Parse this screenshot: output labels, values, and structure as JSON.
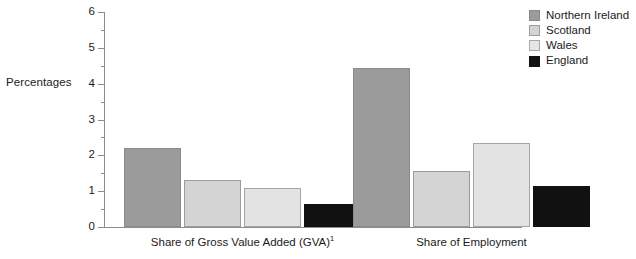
{
  "chart_data": {
    "type": "bar",
    "title": "",
    "xlabel": "",
    "ylabel": "Percentages",
    "ylim": [
      0,
      6
    ],
    "ytick_values": [
      0,
      1,
      2,
      3,
      4,
      5,
      6
    ],
    "ytick_labels": [
      "0",
      "1",
      "2",
      "3",
      "4",
      "5",
      "6"
    ],
    "minor_tick_step": 0.5,
    "grid": false,
    "legend_position": "top-right",
    "categories": [
      "Share of Gross Value Added (GVA)",
      "Share of Employment"
    ],
    "category_footnotes": [
      "1",
      ""
    ],
    "series": [
      {
        "name": "Northern Ireland",
        "color": "#9b9b9b",
        "values": [
          2.2,
          4.45
        ]
      },
      {
        "name": "Scotland",
        "color": "#d4d4d4",
        "values": [
          1.3,
          1.55
        ]
      },
      {
        "name": "Wales",
        "color": "#e3e3e3",
        "values": [
          1.1,
          2.35
        ]
      },
      {
        "name": "England",
        "color": "#111111",
        "values": [
          0.65,
          1.15
        ]
      }
    ]
  },
  "axis": {
    "y_title": "Percentages"
  },
  "legend": {
    "items": [
      {
        "label": "Northern Ireland",
        "swatch": "ni"
      },
      {
        "label": "Scotland",
        "swatch": "scot"
      },
      {
        "label": "Wales",
        "swatch": "wales"
      },
      {
        "label": "England",
        "swatch": "england"
      }
    ]
  },
  "groups": [
    {
      "label": "Share of Gross Value Added (GVA)",
      "footnote": "1"
    },
    {
      "label": "Share of Employment",
      "footnote": ""
    }
  ]
}
